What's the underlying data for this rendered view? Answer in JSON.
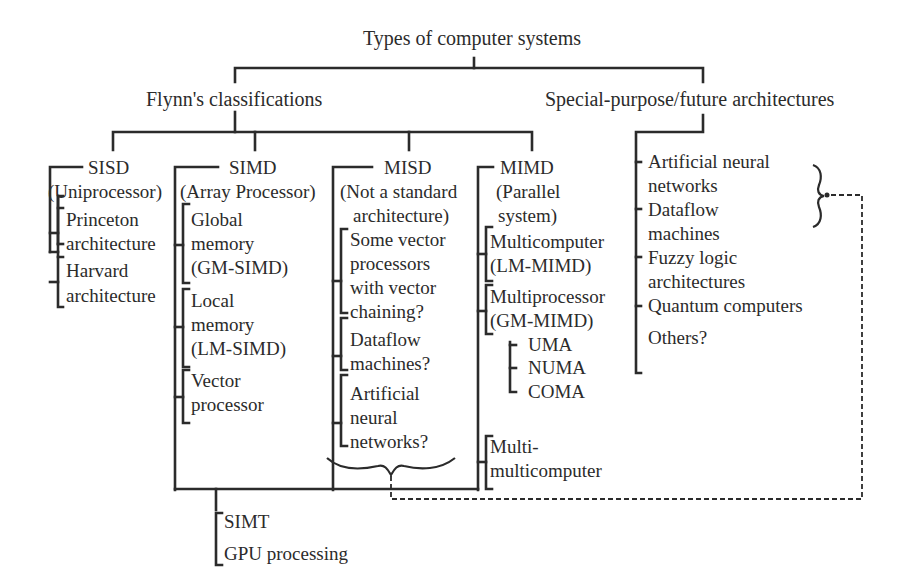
{
  "diagram": {
    "root": "Types of computer systems",
    "branches": {
      "flynn": {
        "label": "Flynn's classifications",
        "children": {
          "sisd": {
            "title": "SISD",
            "subtitle": "(Uniprocessor)",
            "items": [
              [
                "Princeton",
                "architecture"
              ],
              [
                "Harvard",
                "architecture"
              ]
            ]
          },
          "simd": {
            "title": "SIMD",
            "subtitle": "(Array Processor)",
            "items": [
              [
                "Global",
                "memory",
                "(GM-SIMD)"
              ],
              [
                "Local",
                "memory",
                "(LM-SIMD)"
              ],
              [
                "Vector",
                "processor"
              ]
            ]
          },
          "misd": {
            "title": "MISD",
            "subtitle": [
              "(Not a standard",
              "architecture)"
            ],
            "items": [
              [
                "Some vector",
                "processors",
                "with vector",
                "chaining?"
              ],
              [
                "Dataflow",
                "machines?"
              ],
              [
                "Artificial",
                "neural",
                "networks?"
              ]
            ]
          },
          "mimd": {
            "title": "MIMD",
            "subtitle": [
              "(Parallel",
              "system)"
            ],
            "items": [
              [
                "Multicomputer",
                "(LM-MIMD)"
              ],
              [
                "Multiprocessor",
                "(GM-MIMD)"
              ],
              [
                "Multi-",
                "multicomputer"
              ]
            ],
            "multiprocessor_types": [
              "UMA",
              "NUMA",
              "COMA"
            ]
          }
        },
        "combined": [
          "SIMT",
          "GPU processing"
        ]
      },
      "special": {
        "label": "Special-purpose/future architectures",
        "items": [
          [
            "Artificial neural",
            "networks"
          ],
          [
            "Dataflow",
            "machines"
          ],
          [
            "Fuzzy logic",
            "architectures"
          ],
          [
            "Quantum computers"
          ],
          [
            "Others?"
          ]
        ]
      }
    },
    "colors": {
      "line": "#2b2b2b",
      "text": "#2b2b2b",
      "background": "#ffffff"
    }
  }
}
